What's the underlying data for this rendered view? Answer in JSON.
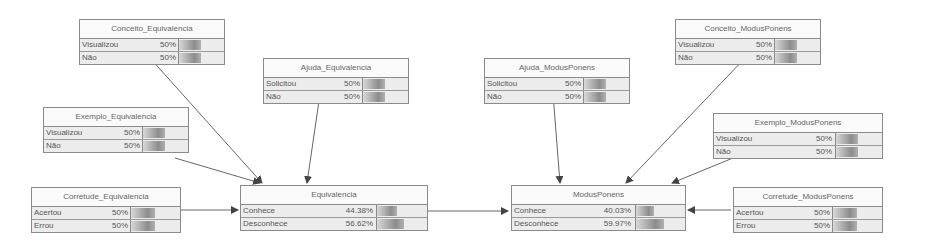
{
  "diagram": {
    "type": "bayesian-network",
    "nodes": {
      "conceito_eq": {
        "title": "Conceito_Equivalencia",
        "states": [
          {
            "label": "Visualizou",
            "value": "50%",
            "p": 50
          },
          {
            "label": "Não",
            "value": "50%",
            "p": 50
          }
        ]
      },
      "ajuda_eq": {
        "title": "Ajuda_Equivalencia",
        "states": [
          {
            "label": "Solicitou",
            "value": "50%",
            "p": 50
          },
          {
            "label": "Não",
            "value": "50%",
            "p": 50
          }
        ]
      },
      "exemplo_eq": {
        "title": "Exemplo_Equivalencia",
        "states": [
          {
            "label": "Visualizou",
            "value": "50%",
            "p": 50
          },
          {
            "label": "Não",
            "value": "50%",
            "p": 50
          }
        ]
      },
      "corretude_eq": {
        "title": "Corretude_Equivalencia",
        "states": [
          {
            "label": "Acertou",
            "value": "50%",
            "p": 50
          },
          {
            "label": "Errou",
            "value": "50%",
            "p": 50
          }
        ]
      },
      "equivalencia": {
        "title": "Equivalencia",
        "states": [
          {
            "label": "Conhece",
            "value": "44.38%",
            "p": 44.38
          },
          {
            "label": "Desconhece",
            "value": "56.62%",
            "p": 56.62
          }
        ]
      },
      "ajuda_mp": {
        "title": "Ajuda_ModusPonens",
        "states": [
          {
            "label": "Solicitou",
            "value": "50%",
            "p": 50
          },
          {
            "label": "Não",
            "value": "50%",
            "p": 50
          }
        ]
      },
      "conceito_mp": {
        "title": "Conceito_ModusPonens",
        "states": [
          {
            "label": "Visualizou",
            "value": "50%",
            "p": 50
          },
          {
            "label": "Não",
            "value": "50%",
            "p": 50
          }
        ]
      },
      "exemplo_mp": {
        "title": "Exemplo_ModusPonens",
        "states": [
          {
            "label": "Visualizou",
            "value": "50%",
            "p": 50
          },
          {
            "label": "Não",
            "value": "50%",
            "p": 50
          }
        ]
      },
      "modusponens": {
        "title": "ModusPonens",
        "states": [
          {
            "label": "Conhece",
            "value": "40.03%",
            "p": 40.03
          },
          {
            "label": "Desconhece",
            "value": "59.97%",
            "p": 59.97
          }
        ]
      },
      "corretude_mp": {
        "title": "Corretude_ModusPonens",
        "states": [
          {
            "label": "Acertou",
            "value": "50%",
            "p": 50
          },
          {
            "label": "Errou",
            "value": "50%",
            "p": 50
          }
        ]
      }
    },
    "edges": [
      [
        "conceito_eq",
        "equivalencia"
      ],
      [
        "ajuda_eq",
        "equivalencia"
      ],
      [
        "exemplo_eq",
        "equivalencia"
      ],
      [
        "corretude_eq",
        "equivalencia"
      ],
      [
        "equivalencia",
        "modusponens"
      ],
      [
        "ajuda_mp",
        "modusponens"
      ],
      [
        "conceito_mp",
        "modusponens"
      ],
      [
        "exemplo_mp",
        "modusponens"
      ],
      [
        "corretude_mp",
        "modusponens"
      ]
    ],
    "colors": {
      "border": "#8a8a8a",
      "fill": "#ececec",
      "edge": "#555555"
    }
  }
}
